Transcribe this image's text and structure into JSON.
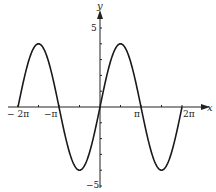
{
  "chart_data": {
    "type": "line",
    "title": "",
    "function": "y = 4 sin x",
    "xlabel": "x",
    "ylabel": "y",
    "xlim": [
      -6.2832,
      6.2832
    ],
    "ylim": [
      -5,
      5
    ],
    "grid": false,
    "legend": null,
    "x_tick_labels": [
      "− 2π",
      "−π",
      "π",
      "2π"
    ],
    "x_tick_values": [
      -6.2832,
      -4.7124,
      -3.1416,
      -1.5708,
      0,
      1.5708,
      3.1416,
      4.7124,
      6.2832
    ],
    "y_tick_labels": [
      "5",
      "−5"
    ],
    "y_tick_values": [
      -5,
      -4,
      -3,
      -2,
      -1,
      0,
      1,
      2,
      3,
      4,
      5
    ],
    "series": [
      {
        "name": "4 sin x",
        "x": [
          -6.2832,
          -4.7124,
          -3.1416,
          -1.5708,
          0,
          1.5708,
          3.1416,
          4.7124,
          6.2832
        ],
        "y": [
          0,
          4,
          0,
          -4,
          0,
          4,
          0,
          -4,
          0
        ]
      }
    ],
    "amplitude": 4,
    "period": "2π"
  },
  "labels": {
    "x_axis": "x",
    "y_axis": "y",
    "y_top": "5",
    "y_bottom": "−5",
    "x_neg2pi": "− 2π",
    "x_negpi": "−π",
    "x_pi": "π",
    "x_2pi": "2π"
  }
}
